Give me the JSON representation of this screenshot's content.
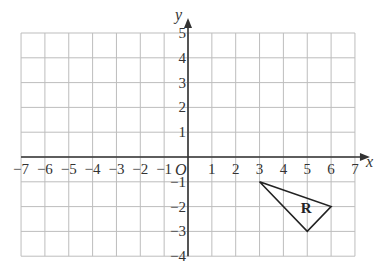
{
  "diagram": {
    "type": "coordinate-grid",
    "x_axis": {
      "label": "x",
      "min": -7,
      "max": 7,
      "ticks": [
        "-7",
        "-6",
        "-5",
        "-4",
        "-3",
        "-2",
        "-1",
        "1",
        "2",
        "3",
        "4",
        "5",
        "6",
        "7"
      ]
    },
    "y_axis": {
      "label": "y",
      "min": -4,
      "max": 5,
      "ticks": [
        "5",
        "4",
        "3",
        "2",
        "1",
        "-1",
        "-2",
        "-3",
        "-4"
      ]
    },
    "origin_label": "O",
    "shape": {
      "label": "R",
      "vertices": [
        [
          3,
          -1
        ],
        [
          6,
          -2
        ],
        [
          5,
          -3
        ]
      ]
    },
    "colors": {
      "grid": "#bdbdbd",
      "axis": "#333333",
      "shape": "#222222"
    }
  }
}
